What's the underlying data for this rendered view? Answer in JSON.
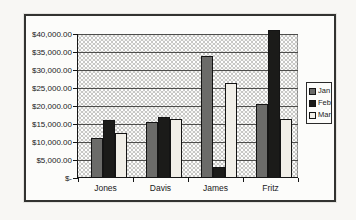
{
  "chart_data": {
    "type": "bar",
    "title": "",
    "xlabel": "",
    "ylabel": "",
    "categories": [
      "Jones",
      "Davis",
      "James",
      "Fritz"
    ],
    "series": [
      {
        "name": "Jan",
        "color": "#6b6b69",
        "values": [
          11000,
          15500,
          34000,
          20500
        ]
      },
      {
        "name": "Feb",
        "color": "#1b1b19",
        "values": [
          16000,
          17000,
          3000,
          41000
        ]
      },
      {
        "name": "Mar",
        "color": "#f1efe8",
        "values": [
          12500,
          16500,
          26500,
          16500
        ]
      }
    ],
    "ylim": [
      0,
      40000
    ],
    "ytick_step": 5000,
    "ytick_labels": [
      "$-",
      "$5,000.00",
      "$10,000.00",
      "$15,000.00",
      "$20,000.00",
      "$25,000.00",
      "$30,000.00",
      "$35,000.00",
      "$40,000.00"
    ],
    "grid": true,
    "legend_position": "right",
    "plot_background": "#c7c7c5",
    "gridline_color": "#4d4d4b",
    "axis_color": "#161616"
  }
}
